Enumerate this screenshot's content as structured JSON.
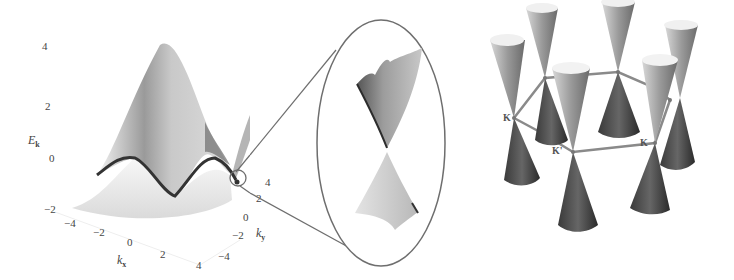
{
  "left_panel": {
    "description": "3D band structure surface E_k over (k_x, k_y)",
    "z_axis": {
      "label": "E",
      "label_sub": "k",
      "ticks": [
        "4",
        "2",
        "0",
        "−2"
      ]
    },
    "x_axis": {
      "label": "k",
      "label_sub": "x",
      "ticks": [
        "−4",
        "−2",
        "0",
        "2",
        "4"
      ]
    },
    "y_axis": {
      "label": "k",
      "label_sub": "y",
      "ticks": [
        "−4",
        "−2",
        "0",
        "2",
        "4"
      ]
    }
  },
  "middle_panel": {
    "description": "Magnified view of a Dirac cone at band touching point"
  },
  "right_panel": {
    "description": "Six Dirac cones at the corners of the hexagonal Brillouin zone",
    "labels": [
      "K",
      "K'",
      "K"
    ]
  },
  "colors": {
    "outline": "#6e6e6e",
    "surface_light": "#e6e6e6",
    "surface_dark": "#3a3a3a",
    "background": "#ffffff"
  }
}
